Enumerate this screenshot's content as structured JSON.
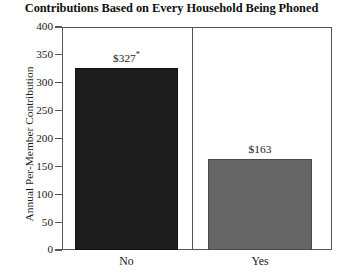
{
  "chart_data": {
    "type": "bar",
    "title": "Contributions Based on Every Household Being Phoned",
    "xlabel": "",
    "ylabel": "Annual Per-Member Contribution",
    "categories": [
      "No",
      "Yes"
    ],
    "values": [
      327,
      163
    ],
    "value_labels": [
      "$327*",
      "$163"
    ],
    "bar_colors": [
      "#1d1d1d",
      "#666666"
    ],
    "ylim": [
      0,
      400
    ],
    "yticks": [
      0,
      50,
      100,
      150,
      200,
      250,
      300,
      350,
      400
    ],
    "ytick_labels": [
      "0",
      "50",
      "100",
      "150",
      "200",
      "250",
      "300",
      "350",
      "400"
    ],
    "grid": false,
    "legend": "none",
    "panel_divider": true,
    "footnote_marker": "*"
  }
}
